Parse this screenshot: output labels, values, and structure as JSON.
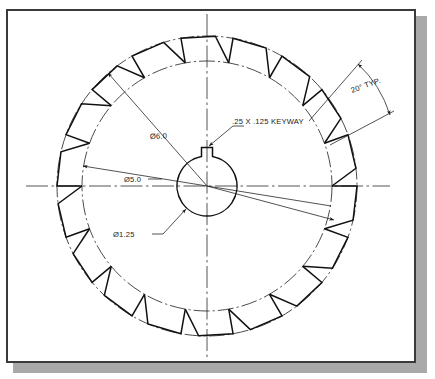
{
  "drawing": {
    "title": "Gear / Ratchet Wheel Detail View",
    "type": "engineering-drawing",
    "view": "front-view",
    "units": "inches",
    "background_color": "#ffffff",
    "line_color": "#1a1a1a",
    "frame_color": "#3a3a3a",
    "shadow_color": "#a9a9a9"
  },
  "annotations": {
    "keyway": ".25 X .125 KEYWAY",
    "outer_diameter": "Ø6.0",
    "root_diameter": "Ø5.0",
    "bore_diameter": "Ø1.25",
    "tooth_angle": "20° TYP."
  },
  "geometry": {
    "center_x": 207,
    "center_y": 186,
    "outer_circle_radius": 150,
    "root_circle_radius": 125,
    "bore_radius": 30,
    "tooth_count": 18,
    "keyway_width": 11,
    "keyway_depth": 9,
    "centerline_vertical_top": 14,
    "centerline_vertical_bottom": 358,
    "centerline_horizontal_left": 26,
    "centerline_horizontal_right": 390
  },
  "chart_data": {
    "type": "diagram",
    "dimensions": [
      {
        "label": "Ø6.0",
        "value": 6.0,
        "feature": "outer/tip diameter"
      },
      {
        "label": "Ø5.0",
        "value": 5.0,
        "feature": "root diameter"
      },
      {
        "label": "Ø1.25",
        "value": 1.25,
        "feature": "center bore diameter"
      },
      {
        "label": ".25 X .125 KEYWAY",
        "value": "0.25 x 0.125",
        "feature": "keyway"
      },
      {
        "label": "20° TYP.",
        "value": 20,
        "feature": "tooth pitch angle"
      }
    ]
  }
}
